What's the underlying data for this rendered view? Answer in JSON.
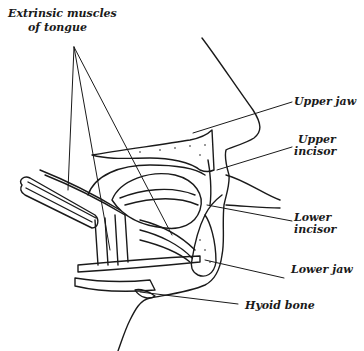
{
  "figure": {
    "type": "anatomical line drawing",
    "ink_color": "#1a1a1a",
    "background": "#ffffff"
  },
  "labels": {
    "extrinsic_line1": "Extrinsic muscles",
    "extrinsic_line2": "of tongue",
    "upper_jaw": "Upper jaw",
    "upper_incisor_line1": "Upper",
    "upper_incisor_line2": "incisor",
    "lower_incisor_line1": "Lower",
    "lower_incisor_line2": "incisor",
    "lower_jaw": "Lower jaw",
    "hyoid_bone": "Hyoid bone"
  }
}
